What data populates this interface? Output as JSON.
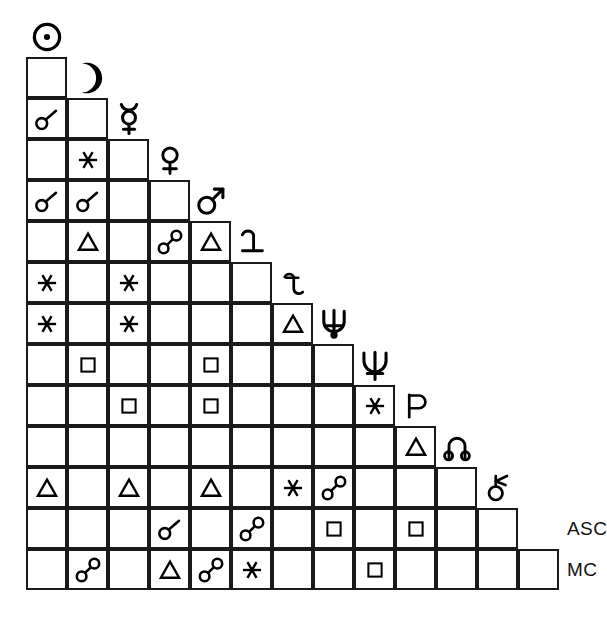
{
  "document": {
    "title": "Astrological Aspectarian Grid",
    "type": "aspect-grid"
  },
  "grid": {
    "origin_x": 26,
    "origin_y": 57,
    "cell": 41,
    "rows": 14,
    "line_color": "#1a1a1a",
    "background": "#ffffff"
  },
  "bodies": [
    {
      "key": "sun",
      "name": "Sun",
      "glyph": "sun-glyph"
    },
    {
      "key": "moon",
      "name": "Moon",
      "glyph": "moon-glyph"
    },
    {
      "key": "mercury",
      "name": "Mercury",
      "glyph": "mercury-glyph"
    },
    {
      "key": "venus",
      "name": "Venus",
      "glyph": "venus-glyph"
    },
    {
      "key": "mars",
      "name": "Mars",
      "glyph": "mars-glyph"
    },
    {
      "key": "jupiter",
      "name": "Jupiter",
      "glyph": "jupiter-glyph"
    },
    {
      "key": "saturn",
      "name": "Saturn",
      "glyph": "saturn-glyph"
    },
    {
      "key": "uranus",
      "name": "Uranus",
      "glyph": "uranus-glyph"
    },
    {
      "key": "neptune",
      "name": "Neptune",
      "glyph": "neptune-glyph"
    },
    {
      "key": "pluto",
      "name": "Pluto",
      "glyph": "pluto-glyph"
    },
    {
      "key": "node",
      "name": "North Node",
      "glyph": "north-node-glyph"
    },
    {
      "key": "lilith",
      "name": "Lilith",
      "glyph": "lilith-glyph"
    },
    {
      "key": "asc",
      "name": "ASC",
      "glyph": "text-label",
      "label": "ASC"
    },
    {
      "key": "mc",
      "name": "MC",
      "glyph": "text-label",
      "label": "MC"
    }
  ],
  "aspect_types": {
    "conjunction": {
      "name": "Conjunction",
      "symbol": "☌",
      "angle": 0
    },
    "opposition": {
      "name": "Opposition",
      "symbol": "☍",
      "angle": 180
    },
    "trine": {
      "name": "Trine",
      "symbol": "△",
      "angle": 120
    },
    "square": {
      "name": "Square",
      "symbol": "□",
      "angle": 90
    },
    "sextile": {
      "name": "Sextile",
      "symbol": "✶",
      "angle": 60
    }
  },
  "chart_data": {
    "type": "table",
    "row_labels": [
      "Sun",
      "Moon",
      "Mercury",
      "Venus",
      "Mars",
      "Jupiter",
      "Saturn",
      "Uranus",
      "Neptune",
      "Pluto",
      "North Node",
      "Lilith",
      "ASC",
      "MC"
    ],
    "column_labels": [
      "Sun",
      "Moon",
      "Mercury",
      "Venus",
      "Mars",
      "Jupiter",
      "Saturn",
      "Uranus",
      "Neptune",
      "Pluto",
      "North Node",
      "Lilith",
      "ASC"
    ],
    "rows": [
      {
        "body": "Moon",
        "cells": [
          null
        ]
      },
      {
        "body": "Mercury",
        "cells": [
          "conjunction",
          null
        ]
      },
      {
        "body": "Venus",
        "cells": [
          null,
          "sextile",
          null
        ]
      },
      {
        "body": "Mars",
        "cells": [
          "conjunction",
          "conjunction",
          null,
          null
        ]
      },
      {
        "body": "Jupiter",
        "cells": [
          null,
          "trine",
          null,
          "opposition",
          "trine"
        ]
      },
      {
        "body": "Saturn",
        "cells": [
          "sextile",
          null,
          "sextile",
          null,
          null,
          null
        ]
      },
      {
        "body": "Uranus",
        "cells": [
          "sextile",
          null,
          "sextile",
          null,
          null,
          null,
          "trine"
        ]
      },
      {
        "body": "Neptune",
        "cells": [
          null,
          "square",
          null,
          null,
          "square",
          null,
          null,
          null
        ]
      },
      {
        "body": "Pluto",
        "cells": [
          null,
          null,
          "square",
          null,
          "square",
          null,
          null,
          null,
          "sextile"
        ]
      },
      {
        "body": "North Node",
        "cells": [
          null,
          null,
          null,
          null,
          null,
          null,
          null,
          null,
          null,
          "trine"
        ]
      },
      {
        "body": "Lilith",
        "cells": [
          "trine",
          null,
          "trine",
          null,
          "trine",
          null,
          "sextile",
          "opposition",
          null,
          null,
          null
        ]
      },
      {
        "body": "ASC",
        "cells": [
          null,
          null,
          null,
          "conjunction",
          null,
          "opposition",
          null,
          "square",
          null,
          "square",
          null,
          null
        ]
      },
      {
        "body": "MC",
        "cells": [
          null,
          "opposition",
          null,
          "trine",
          "opposition",
          "sextile",
          null,
          null,
          "square",
          null,
          null,
          null,
          null
        ]
      }
    ],
    "aspect_counts": {
      "conjunction": 4,
      "opposition": 5,
      "trine": 7,
      "square": 7,
      "sextile": 7
    },
    "legend": [
      "conjunction",
      "opposition",
      "trine",
      "square",
      "sextile"
    ],
    "grid": true
  },
  "labels": {
    "asc": "ASC",
    "mc": "MC"
  }
}
